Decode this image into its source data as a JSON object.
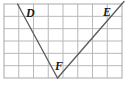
{
  "figure": {
    "name": "angle-dfe-on-grid",
    "background_color": "#ffffff",
    "grid": {
      "columns": 8,
      "rows": 6,
      "x": 4,
      "y": 4,
      "width": 118,
      "height": 74,
      "cell_width": 14.75,
      "cell_height": 12.33,
      "line_color": "#b9b9b9",
      "border_color": "#a8a8a8",
      "line_width": 1
    },
    "rays": {
      "stroke_color": "#5a5a5a",
      "stroke_width": 1.3,
      "segments": [
        {
          "name": "ray-fd",
          "x1": 57.5,
          "y1": 78,
          "x2": 17.5,
          "y2": 4
        },
        {
          "name": "ray-fe",
          "x1": 57.5,
          "y1": 78,
          "x2": 124,
          "y2": 1.5
        }
      ]
    },
    "labels": [
      {
        "name": "vertex-label-d",
        "text": "D",
        "x": 26,
        "y": 17,
        "anchor": "start"
      },
      {
        "name": "vertex-label-e",
        "text": "E",
        "x": 103,
        "y": 16,
        "anchor": "start"
      },
      {
        "name": "vertex-label-f",
        "text": "F",
        "x": 55,
        "y": 70,
        "anchor": "start"
      }
    ]
  }
}
